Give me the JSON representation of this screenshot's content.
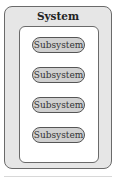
{
  "system": {
    "title": "System",
    "subsystems": [
      {
        "label": "Subsystem"
      },
      {
        "label": "Subsystem"
      },
      {
        "label": "Subsystem"
      },
      {
        "label": "Subsystem"
      }
    ]
  },
  "colors": {
    "outer_fill": "#e6e6e6",
    "inner_fill": "#ffffff",
    "pill_fill": "#d0d0d0",
    "stroke": "#6a6a6a"
  }
}
